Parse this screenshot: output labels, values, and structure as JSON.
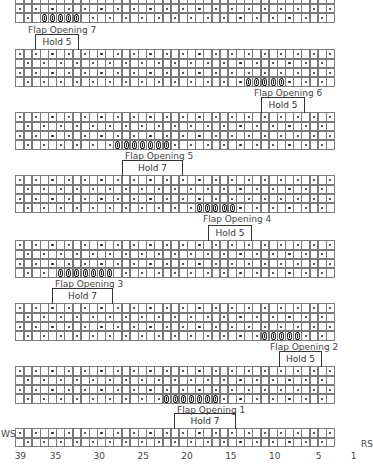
{
  "chart_data": {
    "type": "table",
    "title": "",
    "total_stitches": 39,
    "side_labels": {
      "left": "WS",
      "right": "RS"
    },
    "x_ticks": [
      {
        "label": "39",
        "col": 39
      },
      {
        "label": "35",
        "col": 35
      },
      {
        "label": "30",
        "col": 30
      },
      {
        "label": "25",
        "col": 25
      },
      {
        "label": "20",
        "col": 20
      },
      {
        "label": "15",
        "col": 15
      },
      {
        "label": "10",
        "col": 10
      },
      {
        "label": "5",
        "col": 5
      },
      {
        "label": "1",
        "col": 1
      }
    ],
    "legend": {
      "dot": "stitch marked with dot (alternating pattern)",
      "flap": "flap opening stitch"
    },
    "blocks": [
      {
        "id": "block-flap-7",
        "top": -14,
        "rows": 4,
        "flap_label": "Flap Opening 7",
        "flap_start_index": 3,
        "flap_count": 5,
        "label_x": 28,
        "label_y": 25
      },
      {
        "id": "block-flap-6",
        "top": 50,
        "rows": 4,
        "flap_label": "Flap Opening 6",
        "flap_start_index": 28,
        "flap_count": 5,
        "label_x": 254,
        "label_y": 88,
        "hold_label": "Hold 5",
        "hold_x": 35,
        "hold_w": 44,
        "hold_y": 34
      },
      {
        "id": "block-flap-5",
        "top": 113,
        "rows": 4,
        "flap_label": "Flap Opening 5",
        "flap_start_index": 12,
        "flap_count": 7,
        "label_x": 125,
        "label_y": 151,
        "hold_label": "Hold 5",
        "hold_x": 261,
        "hold_w": 44,
        "hold_y": 97
      },
      {
        "id": "block-flap-4",
        "top": 176,
        "rows": 4,
        "flap_label": "Flap Opening 4",
        "flap_start_index": 22,
        "flap_count": 5,
        "label_x": 203,
        "label_y": 214,
        "hold_label": "Hold 7",
        "hold_x": 122,
        "hold_w": 61,
        "hold_y": 160
      },
      {
        "id": "block-flap-3",
        "top": 241,
        "rows": 4,
        "flap_label": "Flap Opening 3",
        "flap_start_index": 5,
        "flap_count": 7,
        "label_x": 55,
        "label_y": 279,
        "hold_label": "Hold 5",
        "hold_x": 208,
        "hold_w": 44,
        "hold_y": 225
      },
      {
        "id": "block-flap-2",
        "top": 304,
        "rows": 4,
        "flap_label": "Flap Opening 2",
        "flap_start_index": 30,
        "flap_count": 5,
        "label_x": 270,
        "label_y": 342,
        "hold_label": "Hold 7",
        "hold_x": 52,
        "hold_w": 61,
        "hold_y": 288
      },
      {
        "id": "block-flap-1",
        "top": 367,
        "rows": 4,
        "flap_label": "Flap Opening 1",
        "flap_start_index": 18,
        "flap_count": 7,
        "label_x": 177,
        "label_y": 405,
        "hold_label": "Hold 5",
        "hold_x": 279,
        "hold_w": 43,
        "hold_y": 351
      },
      {
        "id": "block-base",
        "top": 429,
        "rows": 2,
        "hold_label": "Hold 7",
        "hold_x": 174,
        "hold_w": 62,
        "hold_y": 413
      }
    ]
  }
}
